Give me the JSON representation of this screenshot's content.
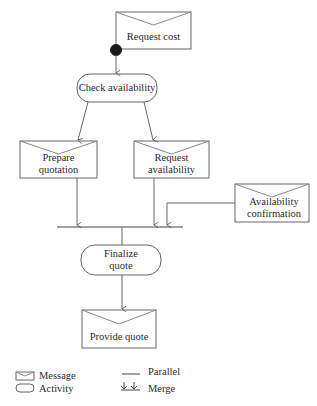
{
  "diagram": {
    "nodes": {
      "request_cost": {
        "type": "message",
        "label": "Request cost"
      },
      "check_availability": {
        "type": "activity",
        "label": "Check availability"
      },
      "prepare_quotation": {
        "type": "message",
        "line1": "Prepare",
        "line2": "quotation"
      },
      "request_availability": {
        "type": "message",
        "line1": "Request",
        "line2": "availability"
      },
      "availability_confirmation": {
        "type": "message",
        "line1": "Availability",
        "line2": "confirmation"
      },
      "finalize_quote": {
        "type": "activity",
        "line1": "Finalize",
        "line2": "quote"
      },
      "provide_quote": {
        "type": "message",
        "label": "Provide quote"
      }
    },
    "edges": [
      {
        "from": "request_cost",
        "to": "check_availability"
      },
      {
        "from": "check_availability",
        "to": "prepare_quotation"
      },
      {
        "from": "check_availability",
        "to": "request_availability"
      },
      {
        "from": "prepare_quotation",
        "to": "parallel_bar"
      },
      {
        "from": "request_availability",
        "to": "parallel_bar",
        "kind": "merge"
      },
      {
        "from": "availability_confirmation",
        "to": "parallel_bar",
        "kind": "merge"
      },
      {
        "from": "parallel_bar",
        "to": "finalize_quote"
      },
      {
        "from": "finalize_quote",
        "to": "provide_quote"
      }
    ]
  },
  "legend": {
    "message": "Message",
    "activity": "Activity",
    "parallel": "Parallel",
    "merge": "Merge"
  },
  "colors": {
    "stroke": "#555555",
    "text": "#2a2a2a",
    "start_dot": "#1a1a1a"
  }
}
